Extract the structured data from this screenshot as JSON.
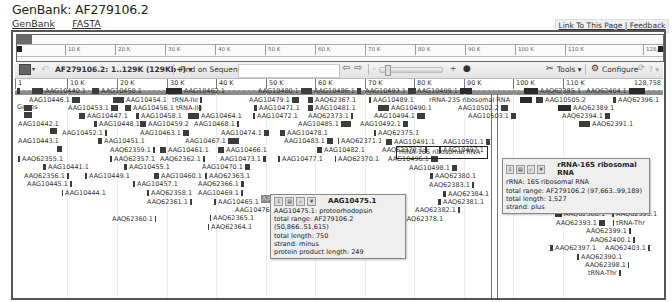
{
  "page": {
    "title": "GenBank: AF279106.2",
    "links": [
      "GenBank",
      "FASTA"
    ],
    "link_box": "Link To This Page | Feedback"
  },
  "overview": {
    "ticks": [
      {
        "label": "10 K",
        "x": 48
      },
      {
        "label": "20 K",
        "x": 98
      },
      {
        "label": "30 K",
        "x": 148
      },
      {
        "label": "40 K",
        "x": 198
      },
      {
        "label": "50 K",
        "x": 248
      },
      {
        "label": "60 K",
        "x": 298
      },
      {
        "label": "70 K",
        "x": 348
      },
      {
        "label": "80 K",
        "x": 398
      },
      {
        "label": "90 K",
        "x": 448
      },
      {
        "label": "100 K",
        "x": 498
      },
      {
        "label": "110 K",
        "x": 548
      }
    ],
    "end_label": "128,7"
  },
  "toolbar": {
    "sequence_range": "AF279106.2: 1..129K (129Kb+)",
    "find_label": "Find on Sequence:",
    "find_value": "",
    "tools_label": "Tools",
    "configure_label": "Configure",
    "help_label": "?"
  },
  "ruler": {
    "start_label": "1",
    "ticks": [
      {
        "label": "10 K",
        "x": 52
      },
      {
        "label": "20 K",
        "x": 102
      },
      {
        "label": "30 K",
        "x": 152
      },
      {
        "label": "40 K",
        "x": 201
      },
      {
        "label": "50 K",
        "x": 251
      },
      {
        "label": "60 K",
        "x": 300
      },
      {
        "label": "70 K",
        "x": 350
      },
      {
        "label": "80 K",
        "x": 399
      },
      {
        "label": "90 K",
        "x": 449
      },
      {
        "label": "100 K",
        "x": 498
      },
      {
        "label": "110 K",
        "x": 548
      }
    ],
    "end_label": "128,758"
  },
  "track": {
    "label": "Genes",
    "genes": [
      {
        "label": "AAG10440.1",
        "x": 30,
        "y": 87,
        "gw": 11,
        "gpos": "before"
      },
      {
        "label": "AAG10450.1",
        "x": 90,
        "y": 87,
        "gw": 7,
        "gpos": "before"
      },
      {
        "label": "AAG10462.1",
        "x": 164,
        "y": 87,
        "gw": 16,
        "gpos": "before",
        "arrow": true
      },
      {
        "label": "",
        "x": 15,
        "y": 87,
        "gw": 3,
        "gpos": "before"
      },
      {
        "label": "AAG10446.1",
        "x": 27,
        "y": 96,
        "gw": 8,
        "gpos": "after"
      },
      {
        "label": "AAG10454.1",
        "x": 111,
        "y": 96,
        "gw": 11,
        "gpos": "before"
      },
      {
        "label": "tRNA-Ile",
        "x": 170,
        "y": 96,
        "gw": 2,
        "gpos": "after"
      },
      {
        "label": "",
        "x": 22,
        "y": 104,
        "gw": 8,
        "gpos": "before"
      },
      {
        "label": "AAG10453.1",
        "x": 66,
        "y": 104,
        "gw": 7,
        "gpos": "after"
      },
      {
        "label": "AAG10456.1 tRNA-Ile",
        "x": 123,
        "y": 104,
        "gw": 6,
        "gpos": "before"
      },
      {
        "label": "",
        "x": 197,
        "y": 104,
        "gw": 2,
        "gpos": "before"
      },
      {
        "label": "",
        "x": 22,
        "y": 111,
        "gw": 8,
        "gpos": "before"
      },
      {
        "label": "AAG10447.1",
        "x": 77,
        "y": 112,
        "gw": 6,
        "gpos": "before"
      },
      {
        "label": "AAG10458.1",
        "x": 134,
        "y": 112,
        "gw": 3,
        "gpos": "before"
      },
      {
        "label": "AAG10464.1",
        "x": 186,
        "y": 112,
        "gw": 11,
        "gpos": "before"
      },
      {
        "label": "AAG10442.1",
        "x": 16,
        "y": 120,
        "gw": 0,
        "gpos": "none"
      },
      {
        "label": "AAG10448.1",
        "x": 92,
        "y": 120,
        "gw": 3,
        "gpos": "before"
      },
      {
        "label": "AAG10459.2",
        "x": 138,
        "y": 120,
        "gw": 6,
        "gpos": "before"
      },
      {
        "label": "AAG10468.1",
        "x": 192,
        "y": 120,
        "gw": 2,
        "gpos": "after"
      },
      {
        "label": "",
        "x": 48,
        "y": 127,
        "gw": 7,
        "gpos": "before"
      },
      {
        "label": "AAG10452.1",
        "x": 60,
        "y": 129,
        "gw": 2,
        "gpos": "after"
      },
      {
        "label": "AAG10463.1",
        "x": 138,
        "y": 129,
        "gw": 6,
        "gpos": "after"
      },
      {
        "label": "AAG10474.1",
        "x": 219,
        "y": 129,
        "gw": 5,
        "gpos": "after"
      },
      {
        "label": "AAG10443.1",
        "x": 16,
        "y": 137,
        "gw": 0,
        "gpos": "none"
      },
      {
        "label": "AAG10451.1",
        "x": 96,
        "y": 137,
        "gw": 4,
        "gpos": "before"
      },
      {
        "label": "AAG10467.1",
        "x": 183,
        "y": 137,
        "gw": 11,
        "gpos": "after"
      },
      {
        "label": "",
        "x": 55,
        "y": 145,
        "gw": 5,
        "gpos": "before"
      },
      {
        "label": "AAQ62359.1",
        "x": 108,
        "y": 146,
        "gw": 2,
        "gpos": "after"
      },
      {
        "label": "AAG10461.1",
        "x": 158,
        "y": 146,
        "gw": 6,
        "gpos": "before"
      },
      {
        "label": "AAG10466.1",
        "x": 216,
        "y": 146,
        "gw": 6,
        "gpos": "before"
      },
      {
        "label": "AAQ62355.1",
        "x": 16,
        "y": 155,
        "gw": 2,
        "gpos": "before"
      },
      {
        "label": "AAQ62357.1",
        "x": 108,
        "y": 155,
        "gw": 2,
        "gpos": "before"
      },
      {
        "label": "AAQ62362.1",
        "x": 158,
        "y": 155,
        "gw": 2,
        "gpos": "after"
      },
      {
        "label": "AAG10473.1",
        "x": 218,
        "y": 155,
        "gw": 3,
        "gpos": "after"
      },
      {
        "label": "AAG10441.1",
        "x": 41,
        "y": 163,
        "gw": 3,
        "gpos": "before"
      },
      {
        "label": "AAG10455.1",
        "x": 122,
        "y": 163,
        "gw": 3,
        "gpos": "before"
      },
      {
        "label": "AAG10470.1",
        "x": 200,
        "y": 163,
        "gw": 5,
        "gpos": "after"
      },
      {
        "label": "AAQ62356.1",
        "x": 22,
        "y": 172,
        "gw": 2,
        "gpos": "after"
      },
      {
        "label": "AAG10449.1",
        "x": 83,
        "y": 172,
        "gw": 2,
        "gpos": "before"
      },
      {
        "label": "AAG10460.1",
        "x": 152,
        "y": 172,
        "gw": 5,
        "gpos": "before"
      },
      {
        "label": "AAQ62363.1",
        "x": 203,
        "y": 172,
        "gw": 2,
        "gpos": "before"
      },
      {
        "label": "AAG10445.1",
        "x": 25,
        "y": 180,
        "gw": 2,
        "gpos": "after"
      },
      {
        "label": "AAG10457.1",
        "x": 131,
        "y": 180,
        "gw": 2,
        "gpos": "before"
      },
      {
        "label": "AAQ62366.1",
        "x": 196,
        "y": 180,
        "gw": 3,
        "gpos": "after"
      },
      {
        "label": "AAG10444.1",
        "x": 60,
        "y": 189,
        "gw": 1,
        "gpos": "before"
      },
      {
        "label": "AAQ62358.1",
        "x": 145,
        "y": 189,
        "gw": 2,
        "gpos": "before"
      },
      {
        "label": "AAG10469.1",
        "x": 196,
        "y": 189,
        "gw": 2,
        "gpos": "after"
      },
      {
        "label": "AAQ62361.1",
        "x": 145,
        "y": 198,
        "gw": 2,
        "gpos": "after"
      },
      {
        "label": "AAG10465.1",
        "x": 212,
        "y": 198,
        "gw": 2,
        "gpos": "before"
      },
      {
        "label": "AAQ62360.1",
        "x": 110,
        "y": 215,
        "gw": 1,
        "gpos": "after"
      },
      {
        "label": "AAG10476.1",
        "x": 233,
        "y": 206,
        "gw": 2,
        "gpos": "after"
      },
      {
        "label": "AAQ62365.1",
        "x": 208,
        "y": 214,
        "gw": 1,
        "gpos": "before"
      },
      {
        "label": "AAQ62364.1",
        "x": 206,
        "y": 223,
        "gw": 1,
        "gpos": "before"
      },
      {
        "label": "AAG10480.1",
        "x": 256,
        "y": 87,
        "gw": 11,
        "gpos": "after"
      },
      {
        "label": "AAG10486.1",
        "x": 312,
        "y": 87,
        "gw": 4,
        "gpos": "after"
      },
      {
        "label": "AAG10493.1",
        "x": 363,
        "y": 87,
        "gw": 8,
        "gpos": "after"
      },
      {
        "label": "AAG10499.1",
        "x": 415,
        "y": 87,
        "gw": 12,
        "gpos": "after",
        "arrow": true
      },
      {
        "label": "AAG10479.1",
        "x": 247,
        "y": 96,
        "gw": 7,
        "gpos": "after"
      },
      {
        "label": "AAQ62367.1",
        "x": 306,
        "y": 96,
        "gw": 5,
        "gpos": "before"
      },
      {
        "label": "AAG10489.1",
        "x": 367,
        "y": 96,
        "gw": 2,
        "gpos": "before"
      },
      {
        "label": "rRNA-23S ribosomal RNA",
        "x": 427,
        "y": 96,
        "gw": 0,
        "gpos": "none"
      },
      {
        "label": "AAG10471.1",
        "x": 252,
        "y": 104,
        "gw": 3,
        "gpos": "before"
      },
      {
        "label": "AAG10481.1",
        "x": 306,
        "y": 104,
        "gw": 5,
        "gpos": "before"
      },
      {
        "label": "AAG10490.1",
        "x": 376,
        "y": 104,
        "gw": 11,
        "gpos": "before"
      },
      {
        "label": "AAG10502.2",
        "x": 456,
        "y": 104,
        "gw": 7,
        "gpos": "after"
      },
      {
        "label": "AAG10472.1",
        "x": 251,
        "y": 112,
        "gw": 2,
        "gpos": "before"
      },
      {
        "label": "AAQ62373.1",
        "x": 306,
        "y": 112,
        "gw": 2,
        "gpos": "after"
      },
      {
        "label": "AAG10494.1",
        "x": 372,
        "y": 112,
        "gw": 8,
        "gpos": "after"
      },
      {
        "label": "AAG10503.1",
        "x": 466,
        "y": 112,
        "gw": 5,
        "gpos": "after"
      },
      {
        "label": "AAG10485.1",
        "x": 296,
        "y": 120,
        "gw": 10,
        "gpos": "after"
      },
      {
        "label": "AAG10492.1",
        "x": 358,
        "y": 120,
        "gw": 5,
        "gpos": "after"
      },
      {
        "label": "AAG10478.1",
        "x": 278,
        "y": 129,
        "gw": 5,
        "gpos": "before"
      },
      {
        "label": "AAQ62375.1",
        "x": 372,
        "y": 129,
        "gw": 2,
        "gpos": "before"
      },
      {
        "label": "AAG10483.1",
        "x": 282,
        "y": 137,
        "gw": 6,
        "gpos": "after"
      },
      {
        "label": "AAQ62371.1",
        "x": 336,
        "y": 137,
        "gw": 1,
        "gpos": "before"
      },
      {
        "label": "AAG10491.1",
        "x": 384,
        "y": 138,
        "gw": 6,
        "gpos": "before"
      },
      {
        "label": "AAG10501.1",
        "x": 441,
        "y": 138,
        "gw": 4,
        "gpos": "after"
      },
      {
        "label": "AAG10482.1",
        "x": 315,
        "y": 146,
        "gw": 5,
        "gpos": "before"
      },
      {
        "label": "AAQ62379.1",
        "x": 380,
        "y": 146,
        "gw": 2,
        "gpos": "after"
      },
      {
        "label": "AAG10497.1",
        "x": 437,
        "y": 146,
        "gw": 2,
        "gpos": "before"
      },
      {
        "label": "AAG10477.1",
        "x": 276,
        "y": 155,
        "gw": 2,
        "gpos": "before"
      },
      {
        "label": "AAQ62370.1",
        "x": 333,
        "y": 155,
        "gw": 1,
        "gpos": "before"
      },
      {
        "label": "AAG10496.1",
        "x": 386,
        "y": 155,
        "gw": 7,
        "gpos": "after"
      },
      {
        "label": "AAG10498.1",
        "x": 407,
        "y": 164,
        "gw": 5,
        "gpos": "after"
      },
      {
        "label": "AAQ62380.1",
        "x": 428,
        "y": 172,
        "gw": 3,
        "gpos": "before"
      },
      {
        "label": "AAQ62383.1",
        "x": 427,
        "y": 181,
        "gw": 2,
        "gpos": "after"
      },
      {
        "label": "AAQ62384.1",
        "x": 441,
        "y": 190,
        "gw": 3,
        "gpos": "before"
      },
      {
        "label": "AAQ62381.1",
        "x": 436,
        "y": 198,
        "gw": 3,
        "gpos": "before"
      },
      {
        "label": "AAQ62382.1",
        "x": 413,
        "y": 206,
        "gw": 2,
        "gpos": "after"
      },
      {
        "label": "AAQ62378.1",
        "x": 396,
        "y": 215,
        "gw": 2,
        "gpos": "before"
      },
      {
        "label": "AAQ62385.1",
        "x": 522,
        "y": 87,
        "gw": 14,
        "gpos": "before",
        "arrow": true
      },
      {
        "label": "AAQ62404.1",
        "x": 584,
        "y": 87,
        "gw": 16,
        "gpos": "after",
        "arrow": true
      },
      {
        "label": "",
        "x": 518,
        "y": 96,
        "gw": 12,
        "gpos": "before",
        "arrow": true
      },
      {
        "label": "AAG10505.2",
        "x": 534,
        "y": 96,
        "gw": 7,
        "gpos": "before"
      },
      {
        "label": "AAQ62396.1",
        "x": 611,
        "y": 96,
        "gw": 3,
        "gpos": "before"
      },
      {
        "label": "AAQ62389.1",
        "x": 556,
        "y": 104,
        "gw": 13,
        "gpos": "before",
        "arrow": true
      },
      {
        "label": "AAQ62394.1",
        "x": 560,
        "y": 112,
        "gw": 5,
        "gpos": "after"
      },
      {
        "label": "AAQ62391.1",
        "x": 577,
        "y": 120,
        "gw": 11,
        "gpos": "before"
      },
      {
        "label": "AAQ62386.1",
        "x": 540,
        "y": 202,
        "gw": 3,
        "gpos": "before"
      },
      {
        "label": "AAQ62402.1",
        "x": 599,
        "y": 202,
        "gw": 2,
        "gpos": "after"
      },
      {
        "label": "AAQ62388.1",
        "x": 553,
        "y": 210,
        "gw": 7,
        "gpos": "before"
      },
      {
        "label": "AAQ62395.1",
        "x": 610,
        "y": 210,
        "gw": 2,
        "gpos": "before"
      },
      {
        "label": "AAQ62393.1",
        "x": 554,
        "y": 219,
        "gw": 6,
        "gpos": "after"
      },
      {
        "label": "tRNA-Thr",
        "x": 611,
        "y": 219,
        "gw": 1,
        "gpos": "before"
      },
      {
        "label": "AAQ62399.1",
        "x": 584,
        "y": 227,
        "gw": 2,
        "gpos": "after"
      },
      {
        "label": "AAQ62400.1",
        "x": 588,
        "y": 236,
        "gw": 2,
        "gpos": "after"
      },
      {
        "label": "AAQ62397.1",
        "x": 548,
        "y": 244,
        "gw": 3,
        "gpos": "before"
      },
      {
        "label": "AAQ62403.1",
        "x": 603,
        "y": 244,
        "gw": 2,
        "gpos": "after"
      },
      {
        "label": "AAQ62390.1",
        "x": 575,
        "y": 253,
        "gw": 2,
        "gpos": "before"
      },
      {
        "label": "AAQ62398.1",
        "x": 583,
        "y": 261,
        "gw": 1,
        "gpos": "after"
      },
      {
        "label": "tRNA-Thr",
        "x": 586,
        "y": 269,
        "gw": 2,
        "gpos": "after"
      }
    ]
  },
  "highlight": {
    "rrna16s_label": "rRNA-16S ribosomal RNA",
    "selected_gene_stub": "AAG"
  },
  "popups": [
    {
      "id": "aag10475",
      "title": "AAG10475.1",
      "lines": [
        "AAG10475.1: proteorhodopsin",
        "total range: AF279106.2 (50,866..51,615)",
        "total length: 750",
        "strand: minus",
        "protein product length: 249"
      ]
    },
    {
      "id": "rrna16s",
      "title": "rRNA-16S ribosomal RNA",
      "lines": [
        "rRNA: 16S ribosomal RNA",
        "total range: AF279106.2 (97,663..99,189)",
        "total length: 1,527",
        "strand: plus"
      ]
    }
  ],
  "colors": {
    "glyph": "#3c3c3c",
    "popup_bg": "#efefef",
    "toolbar_bg": "#e9e9e9",
    "band": "#8c8c8c"
  }
}
